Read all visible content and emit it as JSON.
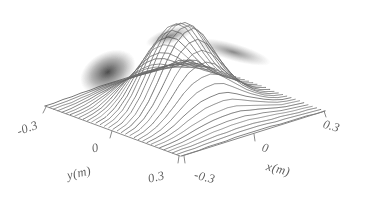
{
  "figure": {
    "kind": "3d-surface-mesh-plot",
    "background_color": "#ffffff",
    "ink_color": "#5e5e5e",
    "shadow_color": "#3a3a3a"
  },
  "axes": {
    "x": {
      "title": "x(m)",
      "ticks": [
        "-0.3",
        "0",
        "0.3"
      ],
      "min": -0.3,
      "max": 0.3
    },
    "y": {
      "title": "y(m)",
      "ticks": [
        "-0.3",
        "0",
        "0.3"
      ],
      "min": -0.3,
      "max": 0.3
    }
  },
  "chart_data": {
    "type": "surface",
    "title": "",
    "subtitle": "",
    "xlabel": "x(m)",
    "ylabel": "y(m)",
    "zlabel": "",
    "xlim": [
      -0.3,
      0.3
    ],
    "ylim": [
      -0.3,
      0.3
    ],
    "zlim": [
      0,
      1
    ],
    "xticks": [
      -0.3,
      0,
      0.3
    ],
    "yticks": [
      -0.3,
      0,
      0.3
    ],
    "xticklabels": [
      "-0.3",
      "0",
      "0.3"
    ],
    "yticklabels": [
      "-0.3",
      "0",
      "0.3"
    ],
    "grid": false,
    "legend": null,
    "render_style": "waterfall-mesh-lines",
    "mesh_line_count": 34,
    "view": {
      "azimuth_deg": -45,
      "elevation_deg": 28,
      "projection": "isometric-diamond"
    },
    "features": [
      {
        "name": "main-peak",
        "x": -0.03,
        "y": -0.02,
        "height_normalized": 1.0,
        "description": "central dominant peak"
      },
      {
        "name": "steep-left-flank",
        "x": -0.16,
        "y": -0.08,
        "height_normalized": 0.55,
        "description": "dark shaded steep drop on the left flank"
      },
      {
        "name": "secondary-step",
        "x": 0.17,
        "y": 0.05,
        "height_normalized": 0.22,
        "description": "small step/shoulder on right side"
      }
    ],
    "x": [
      -0.3,
      -0.2625,
      -0.225,
      -0.1875,
      -0.15,
      -0.1125,
      -0.075,
      -0.0375,
      0,
      0.0375,
      0.075,
      0.1125,
      0.15,
      0.1875,
      0.225,
      0.2625,
      0.3
    ],
    "y": [
      -0.3,
      -0.2625,
      -0.225,
      -0.1875,
      -0.15,
      -0.1125,
      -0.075,
      -0.0375,
      0,
      0.0375,
      0.075,
      0.1125,
      0.15,
      0.1875,
      0.225,
      0.2625,
      0.3
    ],
    "z": [
      [
        0.0,
        0.0,
        0.0,
        0.01,
        0.01,
        0.01,
        0.02,
        0.02,
        0.02,
        0.02,
        0.02,
        0.01,
        0.01,
        0.01,
        0.01,
        0.0,
        0.0
      ],
      [
        0.0,
        0.01,
        0.01,
        0.02,
        0.03,
        0.04,
        0.04,
        0.05,
        0.05,
        0.05,
        0.04,
        0.03,
        0.03,
        0.02,
        0.01,
        0.01,
        0.0
      ],
      [
        0.0,
        0.01,
        0.02,
        0.04,
        0.06,
        0.08,
        0.09,
        0.1,
        0.1,
        0.1,
        0.08,
        0.07,
        0.05,
        0.03,
        0.02,
        0.01,
        0.0
      ],
      [
        0.01,
        0.02,
        0.04,
        0.07,
        0.11,
        0.14,
        0.17,
        0.18,
        0.19,
        0.18,
        0.15,
        0.12,
        0.09,
        0.06,
        0.03,
        0.02,
        0.01
      ],
      [
        0.01,
        0.03,
        0.06,
        0.11,
        0.18,
        0.24,
        0.29,
        0.31,
        0.32,
        0.3,
        0.25,
        0.19,
        0.14,
        0.09,
        0.05,
        0.02,
        0.01
      ],
      [
        0.01,
        0.04,
        0.09,
        0.17,
        0.27,
        0.38,
        0.46,
        0.5,
        0.51,
        0.47,
        0.38,
        0.29,
        0.2,
        0.13,
        0.07,
        0.03,
        0.01
      ],
      [
        0.02,
        0.05,
        0.12,
        0.23,
        0.38,
        0.54,
        0.67,
        0.74,
        0.75,
        0.68,
        0.55,
        0.4,
        0.27,
        0.17,
        0.09,
        0.04,
        0.01
      ],
      [
        0.02,
        0.06,
        0.14,
        0.28,
        0.47,
        0.68,
        0.85,
        0.95,
        0.97,
        0.87,
        0.69,
        0.5,
        0.33,
        0.2,
        0.11,
        0.05,
        0.02
      ],
      [
        0.02,
        0.06,
        0.15,
        0.3,
        0.5,
        0.73,
        0.92,
        1.0,
        1.0,
        0.92,
        0.73,
        0.53,
        0.35,
        0.22,
        0.12,
        0.05,
        0.02
      ],
      [
        0.02,
        0.06,
        0.14,
        0.28,
        0.47,
        0.68,
        0.85,
        0.94,
        0.95,
        0.87,
        0.7,
        0.51,
        0.34,
        0.21,
        0.12,
        0.05,
        0.02
      ],
      [
        0.02,
        0.05,
        0.12,
        0.23,
        0.38,
        0.55,
        0.68,
        0.75,
        0.76,
        0.7,
        0.57,
        0.42,
        0.29,
        0.19,
        0.11,
        0.05,
        0.02
      ],
      [
        0.01,
        0.04,
        0.09,
        0.17,
        0.28,
        0.39,
        0.48,
        0.53,
        0.54,
        0.5,
        0.42,
        0.32,
        0.24,
        0.17,
        0.11,
        0.05,
        0.02
      ],
      [
        0.01,
        0.03,
        0.06,
        0.12,
        0.19,
        0.26,
        0.32,
        0.35,
        0.36,
        0.34,
        0.29,
        0.24,
        0.2,
        0.18,
        0.14,
        0.07,
        0.02
      ],
      [
        0.01,
        0.02,
        0.04,
        0.08,
        0.12,
        0.17,
        0.21,
        0.23,
        0.24,
        0.23,
        0.21,
        0.19,
        0.19,
        0.22,
        0.18,
        0.08,
        0.02
      ],
      [
        0.0,
        0.01,
        0.03,
        0.05,
        0.08,
        0.1,
        0.13,
        0.14,
        0.15,
        0.15,
        0.14,
        0.14,
        0.16,
        0.18,
        0.13,
        0.05,
        0.01
      ],
      [
        0.0,
        0.01,
        0.01,
        0.03,
        0.04,
        0.06,
        0.07,
        0.08,
        0.08,
        0.08,
        0.08,
        0.08,
        0.09,
        0.09,
        0.06,
        0.02,
        0.01
      ],
      [
        0.0,
        0.0,
        0.01,
        0.01,
        0.02,
        0.02,
        0.03,
        0.03,
        0.03,
        0.03,
        0.03,
        0.03,
        0.03,
        0.03,
        0.02,
        0.01,
        0.0
      ]
    ]
  }
}
